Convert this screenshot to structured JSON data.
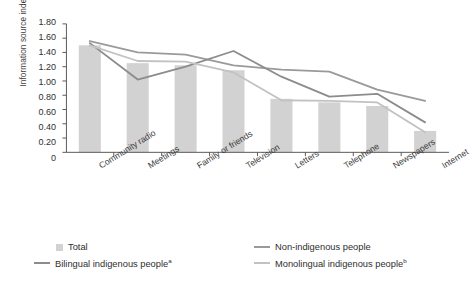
{
  "chart_data": {
    "type": "bar",
    "title": "",
    "xlabel": "",
    "ylabel": "Information source index",
    "ylim": [
      0,
      1.8
    ],
    "ytick_step": 0.2,
    "ytick_labels": [
      "1.80",
      "1.60",
      "1.40",
      "1.20",
      "1.00",
      "0.80",
      "0.60",
      "0.40",
      "0.20",
      "0"
    ],
    "ytick_values": [
      1.8,
      1.6,
      1.4,
      1.2,
      1.0,
      0.8,
      0.6,
      0.4,
      0.2,
      0
    ],
    "grid": false,
    "legend_position": "below-plot",
    "categories": [
      "Community radio",
      "Meetings",
      "Family or friends",
      "Television",
      "Letters",
      "Telephone",
      "Newspapers",
      "Internet"
    ],
    "bar_series": {
      "name": "Total",
      "type": "bar",
      "color": "#d2d2d2",
      "values": [
        1.5,
        1.25,
        1.22,
        1.15,
        0.75,
        0.7,
        0.65,
        0.3
      ]
    },
    "series": [
      {
        "name": "Non-indigenous people",
        "type": "line",
        "color": "#9a9a9a",
        "values": [
          1.56,
          1.4,
          1.37,
          1.22,
          1.16,
          1.13,
          0.88,
          0.72
        ]
      },
      {
        "name": "Bilingual indigenous people",
        "type": "line",
        "color": "#8c8c8c",
        "superscript": "a",
        "values": [
          1.53,
          1.02,
          1.2,
          1.42,
          1.06,
          0.78,
          0.82,
          0.42
        ]
      },
      {
        "name": "Monolingual indigenous people",
        "type": "line",
        "color": "#c2c2c2",
        "superscript": "b",
        "values": [
          1.5,
          1.28,
          1.27,
          1.12,
          0.73,
          0.72,
          0.7,
          0.28
        ]
      }
    ]
  },
  "legend": {
    "total_label": "Total",
    "non_indigenous_label": "Non-indigenous people",
    "bilingual_label": "Bilingual indigenous people",
    "bilingual_sup": "a",
    "monolingual_label": "Monolingual indigenous people",
    "monolingual_sup": "b"
  },
  "colors": {
    "bar": "#d2d2d2",
    "non_indigenous": "#9a9a9a",
    "bilingual": "#8c8c8c",
    "monolingual": "#c2c2c2",
    "axis": "#555555",
    "text": "#333333"
  }
}
